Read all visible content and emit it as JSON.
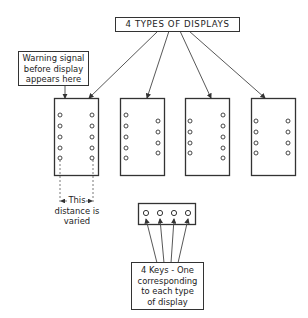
{
  "diagram": {
    "title": "4 TYPES OF DISPLAYS",
    "warning_label": {
      "line1": "Warning signal",
      "line2": "before display",
      "line3": "appears here"
    },
    "distance_label": {
      "line1": "This",
      "line2": "distance is",
      "line3": "varied"
    },
    "keys_label": {
      "line1": "4 Keys - One",
      "line2": "corresponding",
      "line3": "to each type",
      "line4": "of display"
    },
    "displays": [
      {
        "name": "display-1",
        "left_lights": 5,
        "right_lights": 5
      },
      {
        "name": "display-2",
        "left_lights": 5,
        "right_lights": 4
      },
      {
        "name": "display-3",
        "left_lights": 4,
        "right_lights": 5
      },
      {
        "name": "display-4",
        "left_lights": 4,
        "right_lights": 4
      }
    ],
    "keys_count": 4
  }
}
